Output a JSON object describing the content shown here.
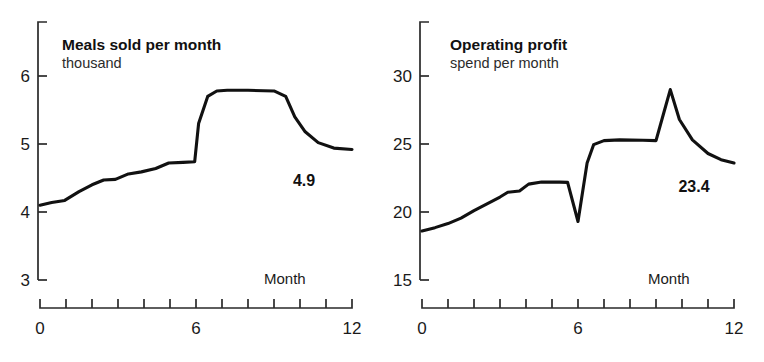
{
  "figure": {
    "background": "#ffffff",
    "line_color": "#111111",
    "axis_color": "#2a2a2a"
  },
  "panels": [
    {
      "id": "meals-sold",
      "title": "Meals sold per month",
      "subtitle": "thousand",
      "x_axis_name": "Month",
      "y_ticks": [
        "3",
        "4",
        "5",
        "6"
      ],
      "x_ticks": [
        "0",
        "6",
        "12"
      ],
      "end_value_label": "4.9"
    },
    {
      "id": "operating-profit",
      "title": "Operating profit",
      "subtitle": "spend per month",
      "x_axis_name": "Month",
      "y_ticks": [
        "15",
        "20",
        "25",
        "30"
      ],
      "x_ticks": [
        "0",
        "6",
        "12"
      ],
      "end_value_label": "23.4"
    }
  ],
  "chart_data": [
    {
      "type": "line",
      "title": "Meals sold per month",
      "subtitle": "thousand",
      "xlabel": "Month",
      "ylabel": "thousand",
      "xlim": [
        0,
        12
      ],
      "ylim": [
        3,
        6
      ],
      "y_tick_values": [
        3,
        4,
        5,
        6
      ],
      "x_tick_values": [
        0,
        1,
        2,
        3,
        4,
        5,
        6,
        7,
        8,
        9,
        10,
        11,
        12
      ],
      "x_tick_labels_shown": [
        "0",
        "6",
        "12"
      ],
      "grid": false,
      "legend": "none",
      "annotations": [
        {
          "text": "4.9",
          "x": 10.6,
          "y": 4.62
        }
      ],
      "x": [
        0.0,
        0.45,
        0.95,
        1.5,
        2.0,
        2.45,
        2.9,
        3.4,
        3.9,
        4.45,
        4.95,
        5.5,
        5.95,
        6.1,
        6.45,
        6.8,
        7.2,
        8.0,
        9.0,
        9.45,
        9.8,
        10.2,
        10.7,
        11.3,
        12.0
      ],
      "y": [
        4.1,
        4.14,
        4.17,
        4.3,
        4.4,
        4.47,
        4.48,
        4.56,
        4.59,
        4.64,
        4.72,
        4.73,
        4.74,
        5.3,
        5.7,
        5.78,
        5.79,
        5.79,
        5.78,
        5.7,
        5.4,
        5.18,
        5.02,
        4.94,
        4.92
      ],
      "end_value": 4.9
    },
    {
      "type": "line",
      "title": "Operating profit",
      "subtitle": "spend per month",
      "xlabel": "Month",
      "ylabel": "spend per month",
      "xlim": [
        0,
        12
      ],
      "ylim": [
        15,
        30
      ],
      "y_tick_values": [
        15,
        20,
        25,
        30
      ],
      "x_tick_values": [
        0,
        1,
        2,
        3,
        4,
        5,
        6,
        7,
        8,
        9,
        10,
        11,
        12
      ],
      "x_tick_labels_shown": [
        "0",
        "6",
        "12"
      ],
      "grid": false,
      "legend": "none",
      "annotations": [
        {
          "text": "23.4",
          "x": 10.3,
          "y": 22.3
        }
      ],
      "x": [
        0.0,
        0.5,
        1.0,
        1.5,
        2.0,
        2.5,
        3.0,
        3.3,
        3.75,
        4.1,
        4.6,
        5.3,
        5.6,
        6.0,
        6.35,
        6.6,
        7.0,
        7.6,
        8.5,
        9.0,
        9.3,
        9.55,
        9.9,
        10.4,
        11.0,
        11.5,
        12.0
      ],
      "y": [
        18.6,
        18.85,
        19.15,
        19.55,
        20.1,
        20.6,
        21.1,
        21.45,
        21.55,
        22.05,
        22.2,
        22.2,
        22.18,
        19.3,
        23.6,
        24.95,
        25.25,
        25.3,
        25.28,
        25.25,
        27.3,
        29.0,
        26.8,
        25.3,
        24.3,
        23.85,
        23.6
      ],
      "end_value": 23.4
    }
  ]
}
